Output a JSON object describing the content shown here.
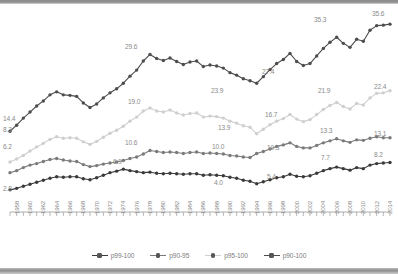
{
  "chart_data": {
    "type": "line",
    "title": "",
    "subtitle": "",
    "xlabel": "",
    "ylabel": "",
    "xlim": [
      1958,
      2015
    ],
    "ylim": [
      0,
      38
    ],
    "grid": false,
    "legend_position": "bottom",
    "x": [
      1958,
      1959,
      1960,
      1961,
      1962,
      1963,
      1964,
      1965,
      1966,
      1967,
      1968,
      1969,
      1970,
      1971,
      1972,
      1973,
      1974,
      1975,
      1976,
      1977,
      1978,
      1979,
      1980,
      1981,
      1982,
      1983,
      1984,
      1985,
      1986,
      1987,
      1988,
      1989,
      1990,
      1991,
      1992,
      1993,
      1994,
      1995,
      1996,
      1997,
      1998,
      1999,
      2000,
      2001,
      2002,
      2003,
      2004,
      2005,
      2006,
      2007,
      2008,
      2009,
      2010,
      2011,
      2012,
      2013,
      2014,
      2015
    ],
    "series": [
      {
        "name": "p90-100",
        "color": "#4d4d4d",
        "values": [
          14.4,
          15.6,
          17.0,
          18.2,
          19.4,
          20.4,
          21.6,
          22.2,
          21.6,
          21.5,
          21.3,
          20.0,
          19.1,
          19.8,
          21.0,
          22.0,
          22.8,
          23.9,
          25.3,
          26.5,
          28.3,
          29.6,
          28.8,
          28.4,
          28.9,
          28.2,
          27.6,
          28.1,
          28.3,
          27.2,
          27.5,
          27.3,
          26.9,
          26.0,
          25.5,
          24.8,
          24.4,
          23.9,
          25.2,
          26.6,
          27.8,
          28.6,
          29.8,
          28.2,
          27.4,
          27.8,
          29.3,
          30.8,
          32.0,
          33.0,
          31.8,
          31.0,
          32.6,
          32.2,
          34.4,
          35.3,
          35.4,
          35.6
        ]
      },
      {
        "name": "p95-100",
        "color": "#cfcfcf",
        "values": [
          8.3,
          8.9,
          9.6,
          10.5,
          11.3,
          12.0,
          12.8,
          13.3,
          13.0,
          13.1,
          13.0,
          12.3,
          11.8,
          12.4,
          13.2,
          14.0,
          14.6,
          15.4,
          16.4,
          17.2,
          18.4,
          19.0,
          18.4,
          18.2,
          18.6,
          18.0,
          17.6,
          17.9,
          18.0,
          17.2,
          17.4,
          17.3,
          17.0,
          16.4,
          16.0,
          15.5,
          15.2,
          13.9,
          14.8,
          15.7,
          16.4,
          16.9,
          17.7,
          16.8,
          16.3,
          16.7,
          17.7,
          18.7,
          19.5,
          20.1,
          19.3,
          18.8,
          19.9,
          19.6,
          21.0,
          21.9,
          22.0,
          22.4
        ]
      },
      {
        "name": "p90-95",
        "color": "#7a7a7a",
        "values": [
          6.2,
          6.6,
          7.2,
          7.7,
          8.0,
          8.4,
          8.8,
          9.0,
          8.7,
          8.5,
          8.4,
          7.8,
          7.4,
          7.6,
          7.9,
          8.1,
          8.3,
          8.6,
          9.0,
          9.3,
          9.9,
          10.6,
          10.4,
          10.2,
          10.3,
          10.2,
          10.0,
          10.2,
          10.3,
          10.0,
          10.1,
          10.0,
          9.9,
          9.6,
          9.5,
          9.3,
          9.2,
          10.0,
          10.4,
          10.9,
          11.4,
          11.7,
          12.1,
          11.4,
          11.1,
          11.1,
          11.6,
          12.1,
          12.5,
          12.9,
          12.5,
          12.2,
          12.7,
          12.6,
          13.0,
          13.3,
          13.1,
          13.1
        ]
      },
      {
        "name": "p99-100",
        "color": "#3a3a3a",
        "values": [
          2.8,
          3.1,
          3.5,
          3.9,
          4.3,
          4.7,
          5.1,
          5.4,
          5.3,
          5.4,
          5.4,
          5.0,
          4.8,
          5.2,
          5.7,
          6.2,
          6.5,
          6.9,
          6.6,
          6.4,
          6.2,
          6.3,
          6.1,
          6.0,
          6.1,
          6.0,
          5.9,
          6.0,
          6.0,
          5.7,
          5.8,
          5.7,
          5.6,
          5.3,
          5.1,
          4.7,
          4.5,
          4.0,
          4.4,
          4.8,
          5.2,
          5.4,
          5.9,
          5.5,
          5.4,
          5.6,
          6.1,
          6.6,
          7.0,
          7.3,
          7.0,
          6.7,
          7.2,
          7.0,
          7.7,
          8.0,
          8.1,
          8.2
        ]
      }
    ],
    "point_labels": [
      {
        "series": "p90-100",
        "year": 1958,
        "text": "14.4",
        "x": 3,
        "y": 116
      },
      {
        "series": "p90-100",
        "year": 1979,
        "text": "29.6",
        "x": 125,
        "y": 44
      },
      {
        "series": "p90-100",
        "year": 1995,
        "text": "23.9",
        "x": 211,
        "y": 88
      },
      {
        "series": "p90-100",
        "year": 2002,
        "text": "27.4",
        "x": 262,
        "y": 69
      },
      {
        "series": "p90-100",
        "year": 2013,
        "text": "35.3",
        "x": 314,
        "y": 17
      },
      {
        "series": "p90-100",
        "year": 2015,
        "text": "35.6",
        "x": 372,
        "y": 11
      },
      {
        "series": "p95-100",
        "year": 1958,
        "text": "8.3",
        "x": 3,
        "y": 127
      },
      {
        "series": "p95-100",
        "year": 1979,
        "text": "19.0",
        "x": 128,
        "y": 99
      },
      {
        "series": "p95-100",
        "year": 1995,
        "text": "13.9",
        "x": 218,
        "y": 125
      },
      {
        "series": "p95-100",
        "year": 2002,
        "text": "16.7",
        "x": 265,
        "y": 112
      },
      {
        "series": "p95-100",
        "year": 2013,
        "text": "21.9",
        "x": 318,
        "y": 88
      },
      {
        "series": "p95-100",
        "year": 2015,
        "text": "22.4",
        "x": 374,
        "y": 84
      },
      {
        "series": "p90-95",
        "year": 1958,
        "text": "6.2",
        "x": 3,
        "y": 144
      },
      {
        "series": "p90-95",
        "year": 1979,
        "text": "10.6",
        "x": 125,
        "y": 140
      },
      {
        "series": "p90-95",
        "year": 1995,
        "text": "10.0",
        "x": 212,
        "y": 144
      },
      {
        "series": "p90-95",
        "year": 2002,
        "text": "10.3",
        "x": 267,
        "y": 145
      },
      {
        "series": "p90-95",
        "year": 2013,
        "text": "13.3",
        "x": 320,
        "y": 128
      },
      {
        "series": "p90-95",
        "year": 2015,
        "text": "13.1",
        "x": 374,
        "y": 131
      },
      {
        "series": "p99-100",
        "year": 1958,
        "text": "2.8",
        "x": 3,
        "y": 186
      },
      {
        "series": "p99-100",
        "year": 1975,
        "text": "6.9",
        "x": 113,
        "y": 159
      },
      {
        "series": "p99-100",
        "year": 1995,
        "text": "4.0",
        "x": 214,
        "y": 180
      },
      {
        "series": "p99-100",
        "year": 2002,
        "text": "5.4",
        "x": 267,
        "y": 174
      },
      {
        "series": "p99-100",
        "year": 2013,
        "text": "7.7",
        "x": 321,
        "y": 155
      },
      {
        "series": "p99-100",
        "year": 2015,
        "text": "8.2",
        "x": 374,
        "y": 152
      }
    ],
    "xticks": [
      "1958",
      "1960",
      "1962",
      "1964",
      "1966",
      "1968",
      "1970",
      "1972",
      "1974",
      "1976",
      "1978",
      "1980",
      "1982",
      "1984",
      "1986",
      "1988",
      "1990",
      "1992",
      "1994",
      "1996",
      "1998",
      "2000",
      "2002",
      "2004",
      "2006",
      "2008",
      "2010",
      "2012",
      "2014"
    ]
  },
  "legend": {
    "items": [
      {
        "label": "p99-100",
        "color": "#3a3a3a"
      },
      {
        "label": "p90-95",
        "color": "#7a7a7a"
      },
      {
        "label": "p95-100",
        "color": "#cfcfcf"
      },
      {
        "label": "p90-100",
        "color": "#4d4d4d"
      }
    ]
  }
}
